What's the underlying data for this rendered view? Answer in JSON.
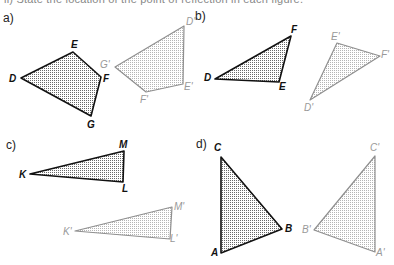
{
  "header": {
    "cut_off_text": "ii)  State the location of the point of reflection in each figure."
  },
  "parts": [
    {
      "label": "a)",
      "label_pos": [
        3,
        11
      ],
      "original": {
        "vertices": [
          {
            "name": "D",
            "x": 21,
            "y": 78,
            "lx": 9,
            "ly": 74
          },
          {
            "name": "E",
            "x": 73,
            "y": 52,
            "lx": 71,
            "ly": 40
          },
          {
            "name": "F",
            "x": 101,
            "y": 77,
            "lx": 103,
            "ly": 74
          },
          {
            "name": "G",
            "x": 91,
            "y": 116,
            "lx": 87,
            "ly": 120
          }
        ]
      },
      "image": {
        "vertices": [
          {
            "name": "D'",
            "x": 184,
            "y": 26,
            "lx": 186,
            "ly": 17
          },
          {
            "name": "E'",
            "x": 183,
            "y": 84,
            "lx": 184,
            "ly": 82
          },
          {
            "name": "F'",
            "x": 146,
            "y": 92,
            "lx": 140,
            "ly": 95
          },
          {
            "name": "G'",
            "x": 115,
            "y": 67,
            "lx": 100,
            "ly": 60
          }
        ]
      }
    },
    {
      "label": "b)",
      "label_pos": [
        195,
        9
      ],
      "original": {
        "vertices": [
          {
            "name": "D",
            "x": 215,
            "y": 79,
            "lx": 204,
            "ly": 73
          },
          {
            "name": "E",
            "x": 279,
            "y": 82,
            "lx": 279,
            "ly": 82
          },
          {
            "name": "F",
            "x": 291,
            "y": 36,
            "lx": 291,
            "ly": 25
          }
        ]
      },
      "image": {
        "vertices": [
          {
            "name": "D'",
            "x": 310,
            "y": 100,
            "lx": 304,
            "ly": 103
          },
          {
            "name": "E'",
            "x": 337,
            "y": 43,
            "lx": 331,
            "ly": 32
          },
          {
            "name": "F'",
            "x": 380,
            "y": 56,
            "lx": 381,
            "ly": 50
          }
        ]
      }
    },
    {
      "label": "c)",
      "label_pos": [
        6,
        138
      ],
      "original": {
        "vertices": [
          {
            "name": "K",
            "x": 30,
            "y": 174,
            "lx": 19,
            "ly": 170
          },
          {
            "name": "L",
            "x": 123,
            "y": 182,
            "lx": 122,
            "ly": 184
          },
          {
            "name": "M",
            "x": 124,
            "y": 151,
            "lx": 119,
            "ly": 140
          }
        ]
      },
      "image": {
        "vertices": [
          {
            "name": "K'",
            "x": 75,
            "y": 231,
            "lx": 63,
            "ly": 227
          },
          {
            "name": "L'",
            "x": 170,
            "y": 239,
            "lx": 170,
            "ly": 234
          },
          {
            "name": "M'",
            "x": 172,
            "y": 207,
            "lx": 174,
            "ly": 202
          }
        ]
      }
    },
    {
      "label": "d)",
      "label_pos": [
        196,
        137
      ],
      "original": {
        "vertices": [
          {
            "name": "A",
            "x": 221,
            "y": 253,
            "lx": 211,
            "ly": 248
          },
          {
            "name": "B",
            "x": 282,
            "y": 229,
            "lx": 285,
            "ly": 224
          },
          {
            "name": "C",
            "x": 221,
            "y": 157,
            "lx": 214,
            "ly": 143
          }
        ]
      },
      "image": {
        "vertices": [
          {
            "name": "A'",
            "x": 375,
            "y": 252,
            "lx": 376,
            "ly": 248
          },
          {
            "name": "B'",
            "x": 314,
            "y": 230,
            "lx": 302,
            "ly": 225
          },
          {
            "name": "C'",
            "x": 375,
            "y": 156,
            "lx": 370,
            "ly": 143
          }
        ]
      }
    }
  ],
  "colors": {
    "original_stroke": "#111111",
    "original_fill_dot": "#6a6a6a",
    "image_stroke": "#8f8f8f",
    "image_fill_dot": "#b5b5b5"
  }
}
